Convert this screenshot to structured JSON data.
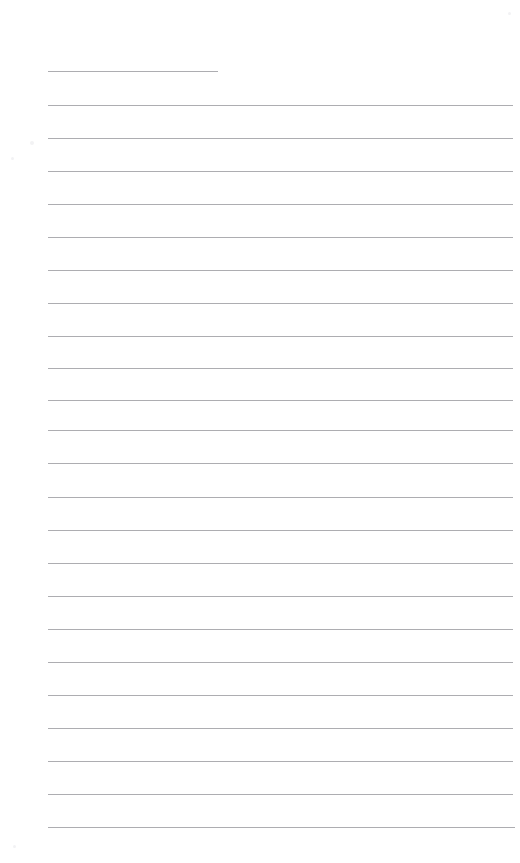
{
  "document": {
    "kind": "lined-paper",
    "title": "Blank Lined Paper",
    "page_width": 520,
    "page_height": 863,
    "background_color": "#ffffff",
    "rule_color": "#a9a9ad",
    "rule_thickness": 1,
    "left_margin": 48,
    "right_edge": 513,
    "first_line_y": 71,
    "line_spacing": 32.8,
    "line_count": 24,
    "content_text": "",
    "lines": [
      {
        "index": 1,
        "y": 71,
        "x_start": 48,
        "x_end": 218,
        "short": true
      },
      {
        "index": 2,
        "y": 105,
        "x_start": 48,
        "x_end": 513,
        "short": false
      },
      {
        "index": 3,
        "y": 138,
        "x_start": 48,
        "x_end": 513,
        "short": false
      },
      {
        "index": 4,
        "y": 171,
        "x_start": 48,
        "x_end": 513,
        "short": false
      },
      {
        "index": 5,
        "y": 204,
        "x_start": 48,
        "x_end": 513,
        "short": false
      },
      {
        "index": 6,
        "y": 237,
        "x_start": 48,
        "x_end": 513,
        "short": false
      },
      {
        "index": 7,
        "y": 270,
        "x_start": 48,
        "x_end": 513,
        "short": false
      },
      {
        "index": 8,
        "y": 303,
        "x_start": 48,
        "x_end": 513,
        "short": false
      },
      {
        "index": 9,
        "y": 336,
        "x_start": 48,
        "x_end": 513,
        "short": false
      },
      {
        "index": 10,
        "y": 368,
        "x_start": 48,
        "x_end": 513,
        "short": false
      },
      {
        "index": 11,
        "y": 400,
        "x_start": 48,
        "x_end": 513,
        "short": false
      },
      {
        "index": 12,
        "y": 430,
        "x_start": 48,
        "x_end": 513,
        "short": false
      },
      {
        "index": 13,
        "y": 463,
        "x_start": 48,
        "x_end": 513,
        "short": false
      },
      {
        "index": 14,
        "y": 497,
        "x_start": 48,
        "x_end": 513,
        "short": false
      },
      {
        "index": 15,
        "y": 530,
        "x_start": 48,
        "x_end": 513,
        "short": false
      },
      {
        "index": 16,
        "y": 563,
        "x_start": 48,
        "x_end": 513,
        "short": false
      },
      {
        "index": 17,
        "y": 596,
        "x_start": 48,
        "x_end": 513,
        "short": false
      },
      {
        "index": 18,
        "y": 629,
        "x_start": 48,
        "x_end": 513,
        "short": false
      },
      {
        "index": 19,
        "y": 662,
        "x_start": 48,
        "x_end": 513,
        "short": false
      },
      {
        "index": 20,
        "y": 695,
        "x_start": 48,
        "x_end": 513,
        "short": false
      },
      {
        "index": 21,
        "y": 728,
        "x_start": 48,
        "x_end": 513,
        "short": false
      },
      {
        "index": 22,
        "y": 761,
        "x_start": 48,
        "x_end": 513,
        "short": false
      },
      {
        "index": 23,
        "y": 794,
        "x_start": 48,
        "x_end": 513,
        "short": false
      },
      {
        "index": 24,
        "y": 827,
        "x_start": 48,
        "x_end": 515,
        "short": false
      }
    ],
    "specks": [
      {
        "x": 30,
        "y": 141,
        "size": 4
      },
      {
        "x": 11,
        "y": 157,
        "size": 3
      },
      {
        "x": 508,
        "y": 12,
        "size": 3
      },
      {
        "x": 13,
        "y": 845,
        "size": 3
      }
    ]
  }
}
